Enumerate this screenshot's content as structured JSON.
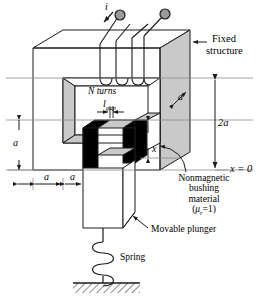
{
  "figure": {
    "type": "engineering-diagram"
  },
  "colors": {
    "line": "#1a1a1a",
    "face_shade": "#c9c9c9",
    "face_shade_dark": "#b4b4b4",
    "gap_black": "#000000",
    "background": "#ffffff",
    "terminal_fill": "#9a9a9a"
  },
  "labels": {
    "current": "i",
    "fixed_structure_line1": "Fixed",
    "fixed_structure_line2": "structure",
    "n_turns": "N turns",
    "l_gap_main": "l",
    "l_gap_sub": "gap",
    "depth_a": "a",
    "height_2a": "2a",
    "x_zero": "x = 0",
    "left_height_a": "a",
    "width_a_1": "a",
    "width_a_2": "a",
    "x_travel": "x",
    "nonmagnetic_line1": "Nonmagnetic",
    "nonmagnetic_line2": "bushing",
    "nonmagnetic_line3": "material",
    "nonmagnetic_mu_open": "(",
    "nonmagnetic_mu_sym": "μ",
    "nonmagnetic_mu_sub": "r",
    "nonmagnetic_mu_val": "=1)",
    "movable_plunger": "Movable plunger",
    "spring": "Spring"
  },
  "icons": {
    "terminal_left": "coil-terminal-icon",
    "terminal_right": "coil-terminal-icon",
    "arrow_current": "current-direction-arrow-icon",
    "arrow_fixed": "leader-arrow-icon",
    "arrow_plunger": "leader-arrow-icon",
    "arrow_bushing": "curved-leader-arrow-icon",
    "spring_coil": "spring-coil-icon",
    "ground_hatch": "ground-hatch-icon"
  }
}
